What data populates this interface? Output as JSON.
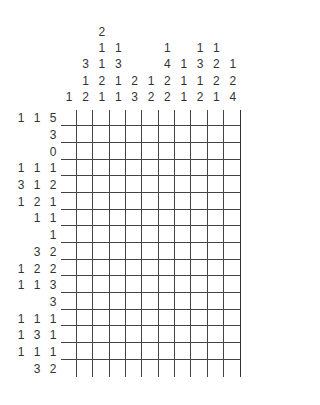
{
  "puzzle": {
    "type": "nonogram",
    "rows": 16,
    "cols": 11,
    "column_clues": [
      [
        1
      ],
      [
        3,
        1,
        2
      ],
      [
        2,
        1,
        1,
        2,
        1
      ],
      [
        1,
        3,
        1,
        1
      ],
      [
        2,
        3
      ],
      [
        1,
        2
      ],
      [
        1,
        4,
        2,
        2
      ],
      [
        1,
        1,
        1
      ],
      [
        1,
        3,
        1,
        2
      ],
      [
        1,
        2,
        2,
        1
      ],
      [
        1,
        2,
        4
      ]
    ],
    "row_clues": [
      [
        1,
        1,
        5
      ],
      [
        3
      ],
      [
        0
      ],
      [
        1,
        1,
        1
      ],
      [
        3,
        1,
        2
      ],
      [
        1,
        2,
        1
      ],
      [
        1,
        1
      ],
      [
        1
      ],
      [
        3,
        2
      ],
      [
        1,
        2,
        2
      ],
      [
        1,
        1,
        3
      ],
      [
        3
      ],
      [
        1,
        1,
        1
      ],
      [
        1,
        3,
        1
      ],
      [
        1,
        1,
        1
      ],
      [
        3,
        2
      ]
    ],
    "cells_filled": []
  }
}
